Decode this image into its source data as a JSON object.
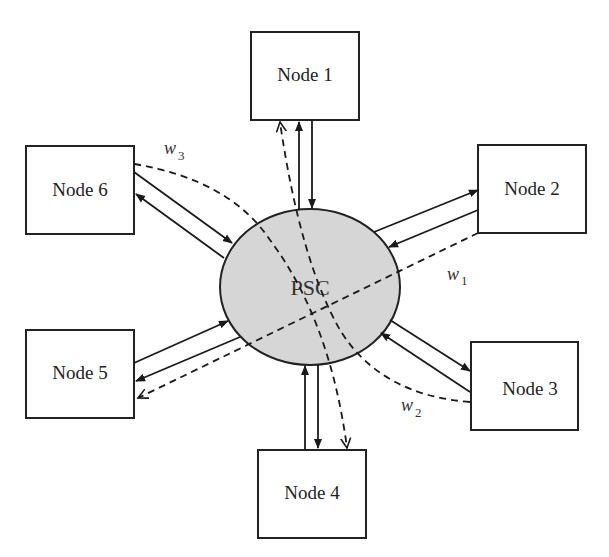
{
  "diagram": {
    "center": {
      "label": "PSC",
      "fill": "#d6d6d6"
    },
    "nodes": [
      {
        "id": "node1",
        "label": "Node 1"
      },
      {
        "id": "node2",
        "label": "Node 2"
      },
      {
        "id": "node3",
        "label": "Node 3"
      },
      {
        "id": "node4",
        "label": "Node 4"
      },
      {
        "id": "node5",
        "label": "Node 5"
      },
      {
        "id": "node6",
        "label": "Node 6"
      }
    ],
    "links": [
      {
        "between": [
          "node1",
          "PSC"
        ],
        "style": "solid",
        "direction": "bidirectional"
      },
      {
        "between": [
          "node2",
          "PSC"
        ],
        "style": "solid",
        "direction": "bidirectional"
      },
      {
        "between": [
          "node3",
          "PSC"
        ],
        "style": "solid",
        "direction": "bidirectional"
      },
      {
        "between": [
          "node4",
          "PSC"
        ],
        "style": "solid",
        "direction": "bidirectional"
      },
      {
        "between": [
          "node5",
          "PSC"
        ],
        "style": "solid",
        "direction": "bidirectional"
      },
      {
        "between": [
          "node6",
          "PSC"
        ],
        "style": "solid",
        "direction": "bidirectional"
      }
    ],
    "wavelength_paths": [
      {
        "label": "w",
        "subscript": "1",
        "from": "node2",
        "to": "node5",
        "style": "dashed"
      },
      {
        "label": "w",
        "subscript": "2",
        "from": "node3",
        "to": "node1",
        "style": "dashed"
      },
      {
        "label": "w",
        "subscript": "3",
        "from": "node6",
        "to": "node4",
        "style": "dashed"
      }
    ]
  }
}
